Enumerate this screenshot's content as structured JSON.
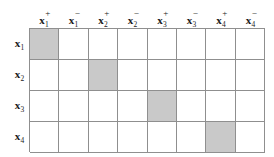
{
  "figure": {
    "title": "",
    "colors": {
      "shaded_cell": "#c9c9c9",
      "empty_cell": "#ffffff",
      "grid_line": "#8f8f8f",
      "text": "#1b1b1b",
      "background": "#ffffff"
    }
  },
  "chart_data": {
    "type": "heatmap",
    "title": "",
    "xlabel": "",
    "ylabel": "",
    "grid": true,
    "legend": "none",
    "columns": [
      {
        "base": "x",
        "sub": "1",
        "sup": "+",
        "label": "x1+"
      },
      {
        "base": "x",
        "sub": "1",
        "sup": "−",
        "label": "x1-"
      },
      {
        "base": "x",
        "sub": "2",
        "sup": "+",
        "label": "x2+"
      },
      {
        "base": "x",
        "sub": "2",
        "sup": "−",
        "label": "x2-"
      },
      {
        "base": "x",
        "sub": "3",
        "sup": "+",
        "label": "x3+"
      },
      {
        "base": "x",
        "sub": "3",
        "sup": "−",
        "label": "x3-"
      },
      {
        "base": "x",
        "sub": "4",
        "sup": "+",
        "label": "x4+"
      },
      {
        "base": "x",
        "sub": "4",
        "sup": "−",
        "label": "x4-"
      }
    ],
    "rows": [
      {
        "base": "x",
        "sub": "1",
        "sup": "",
        "label": "x1"
      },
      {
        "base": "x",
        "sub": "2",
        "sup": "",
        "label": "x2"
      },
      {
        "base": "x",
        "sub": "3",
        "sup": "",
        "label": "x3"
      },
      {
        "base": "x",
        "sub": "4",
        "sup": "",
        "label": "x4"
      }
    ],
    "values": [
      [
        1,
        0,
        0,
        0,
        0,
        0,
        0,
        0
      ],
      [
        0,
        0,
        1,
        0,
        0,
        0,
        0,
        0
      ],
      [
        0,
        0,
        0,
        0,
        1,
        0,
        0,
        0
      ],
      [
        0,
        0,
        0,
        0,
        0,
        0,
        1,
        0
      ]
    ],
    "shaded_cells": [
      {
        "row": "x1",
        "column": "x1+"
      },
      {
        "row": "x2",
        "column": "x2+"
      },
      {
        "row": "x3",
        "column": "x3+"
      },
      {
        "row": "x4",
        "column": "x4+"
      }
    ],
    "n_rows": 4,
    "n_columns": 8
  }
}
